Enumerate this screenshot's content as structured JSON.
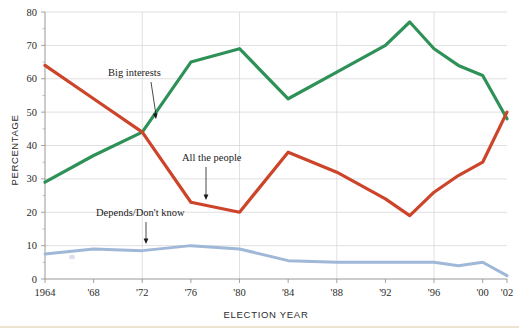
{
  "chart_data": {
    "type": "line",
    "title": "",
    "xlabel": "ELECTION YEAR",
    "ylabel": "PERCENTAGE",
    "xlim": [
      1964,
      2002
    ],
    "ylim": [
      0,
      80
    ],
    "grid": true,
    "legend_position": "inline-annotations",
    "x": [
      1964,
      1968,
      1972,
      1976,
      1980,
      1984,
      1988,
      1992,
      1994,
      1996,
      1998,
      2000,
      2002
    ],
    "xtick_labels": [
      "1964",
      "'68",
      "'72",
      "'76",
      "'80",
      "'84",
      "'88",
      "'92",
      "'96",
      "'00",
      "'02"
    ],
    "xtick_values": [
      1964,
      1968,
      1972,
      1976,
      1980,
      1984,
      1988,
      1992,
      1996,
      2000,
      2002
    ],
    "ytick_labels": [
      "0",
      "10",
      "20",
      "30",
      "40",
      "50",
      "60",
      "70",
      "80"
    ],
    "ytick_values": [
      0,
      10,
      20,
      30,
      40,
      50,
      60,
      70,
      80
    ],
    "yminor_values": [
      5,
      15,
      25,
      35,
      45,
      55,
      65,
      75
    ],
    "gridline_x_values": [
      1972,
      1980,
      1988,
      1996
    ],
    "series": [
      {
        "name": "Big interests",
        "color": "#2e9157",
        "values": [
          29,
          37,
          44,
          65,
          69,
          54,
          62,
          70,
          77,
          69,
          64,
          61,
          48
        ]
      },
      {
        "name": "All the people",
        "color": "#cc4429",
        "values": [
          64,
          54,
          44,
          23,
          20,
          38,
          32,
          24,
          19,
          26,
          31,
          35,
          50
        ]
      },
      {
        "name": "Depends/Don't know",
        "color": "#9fb8d8",
        "values": [
          7.5,
          9,
          8.5,
          10,
          9,
          5.5,
          5,
          5,
          5,
          5,
          4,
          5,
          1
        ]
      }
    ],
    "annotations": [
      {
        "label": "Big interests",
        "series": "Big interests",
        "text_x": 108,
        "text_y": 76,
        "arrow_from_x": 151,
        "arrow_from_y": 82,
        "arrow_to_x": 156,
        "arrow_to_y": 119
      },
      {
        "label": "All the people",
        "series": "All the people",
        "text_x": 182,
        "text_y": 161,
        "arrow_from_x": 206,
        "arrow_from_y": 167,
        "arrow_to_x": 206,
        "arrow_to_y": 200
      },
      {
        "label": "Depends/Don't know",
        "series": "Depends/Don't know",
        "text_x": 96,
        "text_y": 216,
        "arrow_from_x": 146,
        "arrow_from_y": 222,
        "arrow_to_x": 146,
        "arrow_to_y": 244
      }
    ]
  }
}
